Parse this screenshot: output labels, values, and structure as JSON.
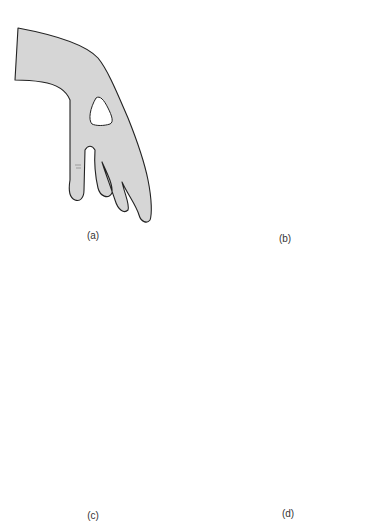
{
  "figure": {
    "panels": [
      {
        "id": "a",
        "label": "(a)",
        "description": "Wrist drop with dorsal triangular area of sensory loss"
      },
      {
        "id": "b",
        "label": "(b)",
        "description": "Hand with ulnar-side fingers flexed (claw) and pale ulnar area"
      },
      {
        "id": "c",
        "label": "(c)",
        "description": "Palm with shaded ulnar border region"
      },
      {
        "id": "d",
        "label": "(d)",
        "description": "Clawed hand posture, dorsal view"
      }
    ],
    "colors": {
      "skin_shaded": "#d6d6d6",
      "skin_pale": "#f2f2f2",
      "outline": "#222222",
      "background": "#ffffff"
    }
  }
}
